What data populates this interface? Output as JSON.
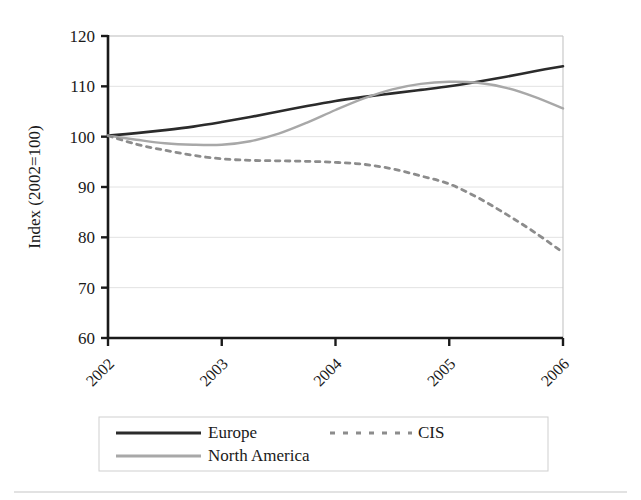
{
  "chart_data": {
    "type": "line",
    "title": "",
    "xlabel": "",
    "ylabel": "Index (2002=100)",
    "xlim": [
      2002,
      2006
    ],
    "ylim": [
      60,
      120
    ],
    "yticks": [
      60,
      70,
      80,
      90,
      100,
      110,
      120
    ],
    "xticks": [
      2002,
      2003,
      2004,
      2005,
      2006
    ],
    "xtick_labels": [
      "2002",
      "2003",
      "2004",
      "2005",
      "2006"
    ],
    "ytick_labels": [
      "60",
      "70",
      "80",
      "90",
      "100",
      "110",
      "120"
    ],
    "grid": true,
    "grid_axis": "y",
    "legend_position": "bottom",
    "x": [
      2002,
      2002.25,
      2002.5,
      2002.75,
      2003,
      2003.25,
      2003.5,
      2003.75,
      2004,
      2004.25,
      2004.5,
      2004.75,
      2005,
      2005.25,
      2005.5,
      2005.75,
      2006
    ],
    "series": [
      {
        "name": "Europe",
        "color": "#2b2b2b",
        "style": "solid",
        "width": 2.6,
        "values": [
          100.2,
          100.7,
          101.3,
          102.0,
          102.9,
          103.9,
          105.0,
          106.1,
          107.1,
          107.9,
          108.6,
          109.3,
          110.0,
          110.9,
          111.9,
          113.0,
          114.0
        ]
      },
      {
        "name": "North America",
        "color": "#a8a8a8",
        "style": "solid",
        "width": 2.4,
        "values": [
          100.2,
          99.4,
          98.7,
          98.4,
          98.4,
          99.1,
          100.6,
          102.8,
          105.3,
          107.6,
          109.4,
          110.5,
          110.9,
          110.7,
          109.7,
          107.9,
          105.6
        ]
      },
      {
        "name": "CIS",
        "color": "#8c8c8c",
        "style": "dashed",
        "width": 2.8,
        "values": [
          100.2,
          98.5,
          97.3,
          96.3,
          95.6,
          95.3,
          95.2,
          95.1,
          94.9,
          94.5,
          93.6,
          92.2,
          90.6,
          87.9,
          84.6,
          81.0,
          77.0
        ]
      }
    ],
    "legend_entries": [
      {
        "label": "Europe",
        "color": "#2b2b2b",
        "style": "solid"
      },
      {
        "label": "CIS",
        "color": "#8c8c8c",
        "style": "dashed"
      },
      {
        "label": "North America",
        "color": "#a8a8a8",
        "style": "solid"
      }
    ],
    "colors": {
      "axis": "#1a1a1a",
      "grid": "#e2e2e2",
      "background": "#ffffff",
      "legend_border": "#cfcfcf",
      "footer_rule": "#d8d8d8"
    }
  }
}
